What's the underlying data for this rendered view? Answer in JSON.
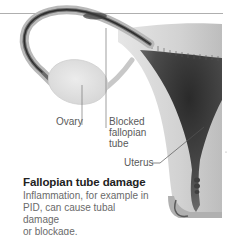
{
  "figure": {
    "type": "anatomical-illustration",
    "labels": {
      "ovary": "Ovary",
      "blocked_tube_line1": "Blocked",
      "blocked_tube_line2": "fallopian",
      "blocked_tube_line3": "tube",
      "uterus": "Uterus"
    },
    "colors": {
      "tissue_light": "#dcdcdc",
      "tissue_mid": "#a8a8a8",
      "cavity_dark": "#3a3a3a",
      "leader_line": "#777777",
      "label_text": "#5a5a5a"
    }
  },
  "caption": {
    "title": "Fallopian tube damage",
    "body_line1": "Inflammation, for example in",
    "body_line2": "PID, can cause tubal damage",
    "body_line3": "or blockage."
  }
}
